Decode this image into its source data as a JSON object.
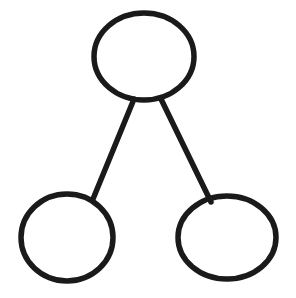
{
  "diagram": {
    "style": "hand-drawn",
    "background_color": "#ffffff",
    "stroke_color": "#1a1a1a",
    "stroke_width": 5.5,
    "canvas": {
      "width": 296,
      "height": 298
    },
    "nodes": [
      {
        "id": "root",
        "name": "top-node",
        "label": "",
        "role": "parent",
        "shape": "ellipse",
        "center_x": 144,
        "center_y": 56.5,
        "radius_x": 50,
        "radius_y": 43.5
      },
      {
        "id": "child-left",
        "name": "bottom-left-node",
        "label": "",
        "role": "child",
        "shape": "ellipse",
        "center_x": 67,
        "center_y": 237.5,
        "radius_x": 46,
        "radius_y": 43.5
      },
      {
        "id": "child-right",
        "name": "bottom-right-node",
        "label": "",
        "role": "child",
        "shape": "ellipse",
        "center_x": 227,
        "center_y": 237.5,
        "radius_x": 49,
        "radius_y": 41.5
      }
    ],
    "edges": [
      {
        "id": "edge-root-left",
        "name": "edge-top-to-bottom-left",
        "from": "root",
        "to": "child-left",
        "type": "straight",
        "x1": 134,
        "y1": 99,
        "x2": 93,
        "y2": 199
      },
      {
        "id": "edge-root-right",
        "name": "edge-top-to-bottom-right",
        "from": "root",
        "to": "child-right",
        "type": "straight",
        "x1": 161,
        "y1": 99,
        "x2": 211,
        "y2": 202
      }
    ],
    "node_count": 3,
    "edge_count": 2
  }
}
